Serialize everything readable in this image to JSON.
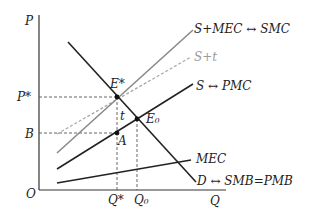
{
  "diagram": {
    "type": "economics-externality-pigouvian-tax",
    "axes": {
      "y_label": "P",
      "x_label": "Q",
      "origin_label": "O"
    },
    "price_labels": {
      "p_star": "P*",
      "b": "B"
    },
    "quantity_labels": {
      "q_star": "Q*",
      "q0": "Q₀"
    },
    "points": {
      "e_star": "E*",
      "e0": "E₀",
      "a": "A",
      "t": "t"
    },
    "curves": {
      "smc": {
        "label": "S+MEC ↔ SMC",
        "color": "#8a8a8a"
      },
      "s_plus_t": {
        "label": "S+t",
        "color": "#a8a8a8",
        "style": "dashed"
      },
      "pmc": {
        "label": "S ↔ PMC",
        "color": "#222222"
      },
      "mec": {
        "label": "MEC",
        "color": "#222222"
      },
      "demand": {
        "label": "D ↔ SMB=PMB",
        "color": "#222222"
      }
    },
    "colors": {
      "axis": "#333333",
      "dashed_guides": "#555555"
    }
  }
}
